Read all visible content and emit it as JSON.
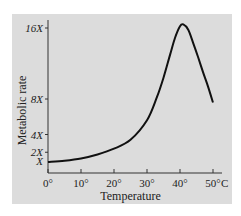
{
  "chart_data": {
    "type": "line",
    "title": "",
    "xlabel": "Temperature",
    "ylabel": "Metabolic rate",
    "x_unit_label": "C",
    "xlim": [
      0,
      50
    ],
    "ylim": [
      0,
      17
    ],
    "x_ticks": [
      0,
      10,
      20,
      30,
      40,
      50
    ],
    "x_tick_labels": [
      "0°",
      "10°",
      "20°",
      "30°",
      "40°",
      "50°"
    ],
    "y_ticks": [
      1,
      2,
      4,
      8,
      16
    ],
    "y_tick_labels": [
      "X",
      "2X",
      "4X",
      "8X",
      "16X"
    ],
    "grid": false,
    "series": [
      {
        "name": "Metabolic rate",
        "x": [
          0,
          5,
          10,
          15,
          20,
          25,
          30,
          33,
          35,
          37,
          38.5,
          40,
          41,
          42.5,
          44,
          45.5,
          47,
          48.5,
          50
        ],
        "y": [
          0.9,
          1.05,
          1.3,
          1.75,
          2.4,
          3.4,
          5.6,
          8.2,
          10.4,
          13.0,
          14.9,
          16.2,
          16.4,
          15.8,
          14.3,
          12.7,
          11.0,
          9.4,
          7.6
        ]
      }
    ]
  }
}
